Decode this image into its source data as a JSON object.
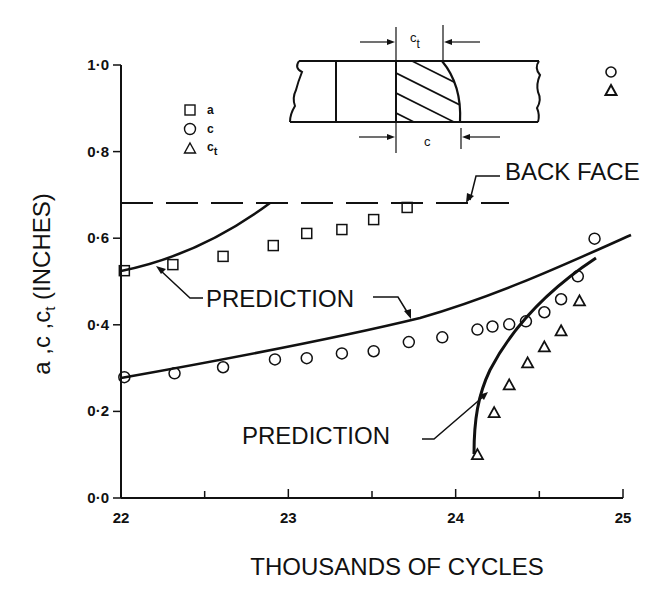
{
  "chart_data": {
    "type": "scatter",
    "title": "",
    "xlabel": "THOUSANDS OF CYCLES",
    "ylabel": "a ,c ,cₜ (INCHES)",
    "xlim": [
      22,
      25
    ],
    "ylim": [
      0.0,
      1.0
    ],
    "x_ticks": [
      "22",
      "23",
      "24",
      "25"
    ],
    "y_ticks": [
      "0·0",
      "0·2",
      "0·4",
      "0·6",
      "0·8",
      "1·0"
    ],
    "grid": false,
    "legend_position": "upper-left (inside plot)",
    "legend": [
      {
        "marker": "square",
        "label": "a"
      },
      {
        "marker": "circle",
        "label": "c"
      },
      {
        "marker": "triangle",
        "label": "c",
        "subscript": "t"
      }
    ],
    "series": [
      {
        "name": "a",
        "marker": "square",
        "x": [
          22.02,
          22.31,
          22.61,
          22.91,
          23.11,
          23.32,
          23.51,
          23.71
        ],
        "y": [
          0.525,
          0.539,
          0.558,
          0.583,
          0.611,
          0.62,
          0.643,
          0.671
        ]
      },
      {
        "name": "c",
        "marker": "circle",
        "x": [
          22.02,
          22.32,
          22.61,
          22.92,
          23.11,
          23.32,
          23.51,
          23.72,
          23.92,
          24.13,
          24.22,
          24.32,
          24.42,
          24.53,
          24.63,
          24.73,
          24.83
        ],
        "y": [
          0.279,
          0.288,
          0.302,
          0.32,
          0.323,
          0.334,
          0.339,
          0.36,
          0.371,
          0.389,
          0.396,
          0.401,
          0.408,
          0.429,
          0.459,
          0.512,
          0.599
        ]
      },
      {
        "name": "c_t",
        "marker": "triangle",
        "x": [
          24.13,
          24.23,
          24.32,
          24.43,
          24.53,
          24.63,
          24.74
        ],
        "y": [
          0.099,
          0.196,
          0.26,
          0.311,
          0.348,
          0.385,
          0.454
        ]
      },
      {
        "name": "prediction (a)",
        "type": "line",
        "x": [
          22.0,
          22.2,
          22.4,
          22.6,
          22.8,
          22.9
        ],
        "y": [
          0.527,
          0.545,
          0.575,
          0.612,
          0.657,
          0.682
        ]
      },
      {
        "name": "prediction (c)",
        "type": "line",
        "x": [
          22.0,
          22.5,
          23.0,
          23.5,
          24.0,
          24.5,
          25.0
        ],
        "y": [
          0.28,
          0.31,
          0.345,
          0.39,
          0.45,
          0.53,
          0.608
        ]
      },
      {
        "name": "prediction (c_t)",
        "type": "line",
        "x": [
          24.12,
          24.14,
          24.2,
          24.3,
          24.45,
          24.6,
          24.75
        ],
        "y": [
          0.1,
          0.18,
          0.26,
          0.34,
          0.42,
          0.49,
          0.553
        ]
      }
    ],
    "reference_lines": [
      {
        "name": "back face",
        "style": "dashed",
        "y": 0.682,
        "x_range": [
          22.0,
          24.32
        ]
      }
    ],
    "annotations": [
      {
        "text": "BACK FACE",
        "points_to": "dashed line"
      },
      {
        "text": "PREDICTION",
        "points_to": [
          "prediction (a)",
          "prediction (c)"
        ]
      },
      {
        "text": "PREDICTION",
        "points_to": "prediction (c_t)"
      }
    ],
    "offscale_markers": [
      {
        "marker": "circle",
        "position": "upper-right, above plot"
      },
      {
        "marker": "triangle",
        "position": "upper-right, above plot"
      }
    ],
    "inset": {
      "description": "Plate cross-section showing hatched crack region with curved crack front",
      "dimension_labels": [
        {
          "label": "c",
          "subscript": "t",
          "position": "top"
        },
        {
          "label": "c",
          "position": "bottom"
        }
      ]
    }
  },
  "labels": {
    "xlabel": "THOUSANDS OF CYCLES",
    "ylabel_main": "a ,c ,c",
    "ylabel_sub": "t",
    "ylabel_tail": " (INCHES)",
    "back_face": "BACK FACE",
    "prediction_1": "PREDICTION",
    "prediction_2": "PREDICTION",
    "legend_a": "a",
    "legend_c": "c",
    "legend_ct": "c",
    "legend_ct_sub": "t",
    "inset_ct": "c",
    "inset_ct_sub": "t",
    "inset_c": "c",
    "x_ticks": [
      "22",
      "23",
      "24",
      "25"
    ],
    "y_ticks": [
      "0·0",
      "0·2",
      "0·4",
      "0·6",
      "0·8",
      "1·0"
    ]
  },
  "colors": {
    "ink": "#111111",
    "background": "#ffffff"
  }
}
